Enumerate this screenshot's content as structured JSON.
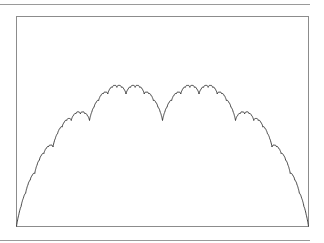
{
  "chart_data": {
    "type": "line",
    "title": "",
    "xlabel": "",
    "ylabel": "",
    "function": "T(x) = sum_{n>=0} dist(2^n x, Z) / 2^n",
    "xlim": [
      0,
      1
    ],
    "ylim": [
      0,
      1.0
    ],
    "grid": false,
    "legend": null,
    "key_points": [
      {
        "x": 0,
        "y": 0
      },
      {
        "x": 0.25,
        "y": 0.5
      },
      {
        "x": 0.3333,
        "y": 0.6667
      },
      {
        "x": 0.5,
        "y": 0.5
      },
      {
        "x": 0.6667,
        "y": 0.6667
      },
      {
        "x": 0.75,
        "y": 0.5
      },
      {
        "x": 1,
        "y": 0
      }
    ],
    "iterations": 12,
    "samples": 1025
  },
  "colors": {
    "line": "#333333",
    "frame": "#8c8c8c",
    "rule": "#9a9a9a",
    "background": "#ffffff"
  }
}
